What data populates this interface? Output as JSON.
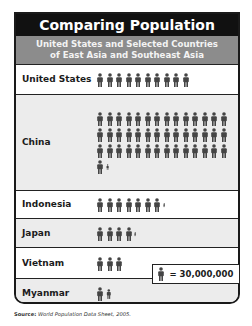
{
  "title": "Comparing Population",
  "subtitle_line1": "United States and Selected Countries",
  "subtitle_line2": "of East Asia and Southeast Asia",
  "legend": {
    "icon": "person-icon",
    "text": "= 30,000,000"
  },
  "source_label": "Source:",
  "source_text": "World Population Data Sheet, 2005.",
  "colors": {
    "header_bg": "#111111",
    "subheader_bg": "#8c8c8c",
    "icon": "#444444",
    "row_alt": "#ececec"
  },
  "chart_data": {
    "type": "pictograph",
    "title": "Comparing Population",
    "subtitle": "United States and Selected Countries of East Asia and Southeast Asia",
    "unit_label": "1 figure = 30,000,000 people",
    "unit_value": 30000000,
    "categories": [
      "United States",
      "China",
      "Indonesia",
      "Japan",
      "Vietnam",
      "Myanmar"
    ],
    "icon_counts": [
      10,
      43.3,
      7.3,
      4.3,
      3,
      1.7
    ],
    "values": [
      300000000,
      1300000000,
      220000000,
      128000000,
      90000000,
      50000000
    ],
    "source": "World Population Data Sheet, 2005."
  },
  "rows": [
    {
      "label": "United States",
      "full": 10,
      "partial": 0
    },
    {
      "label": "China",
      "full": 43,
      "partial": 0.4
    },
    {
      "label": "Indonesia",
      "full": 7,
      "partial": 0.3
    },
    {
      "label": "Japan",
      "full": 4,
      "partial": 0.3
    },
    {
      "label": "Vietnam",
      "full": 3,
      "partial": 0
    },
    {
      "label": "Myanmar",
      "full": 1,
      "partial": 0.7
    }
  ]
}
